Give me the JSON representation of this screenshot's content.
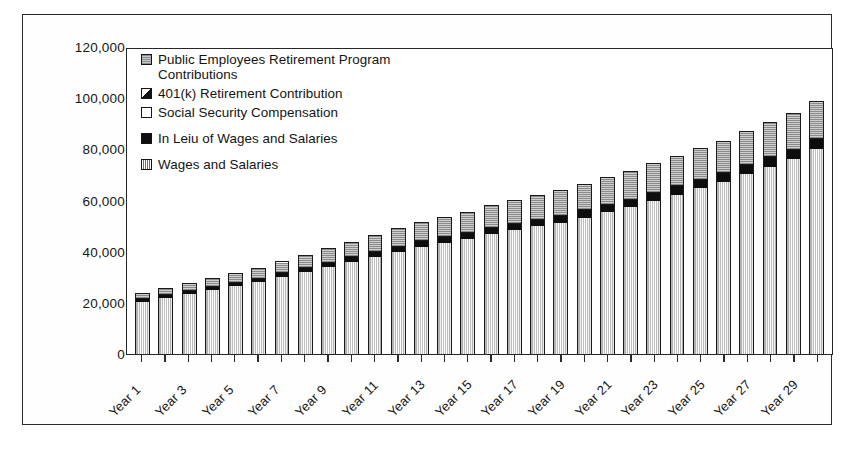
{
  "chart_data": {
    "type": "bar",
    "stacked": true,
    "title": "",
    "subtitle": "",
    "xlabel": "",
    "ylabel": "",
    "ylim": [
      0,
      120000
    ],
    "ytick_labels": [
      "120,000",
      "100,000",
      "80,000",
      "60,000",
      "40,000",
      "20,000",
      "0"
    ],
    "ytick_values": [
      120000,
      100000,
      80000,
      60000,
      40000,
      20000,
      0
    ],
    "grid": false,
    "legend_position": "top-left-inside",
    "categories": [
      "Year 1",
      "Year 2",
      "Year 3",
      "Year 4",
      "Year 5",
      "Year 6",
      "Year 7",
      "Year 8",
      "Year 9",
      "Year 10",
      "Year 11",
      "Year 12",
      "Year 13",
      "Year 14",
      "Year 15",
      "Year 16",
      "Year 17",
      "Year 18",
      "Year 19",
      "Year 20",
      "Year 21",
      "Year 22",
      "Year 23",
      "Year 24",
      "Year 25",
      "Year 26",
      "Year 27",
      "Year 28",
      "Year 29",
      "Year 30"
    ],
    "visible_tick_labels": [
      "Year 1",
      "Year 3",
      "Year 5",
      "Year 7",
      "Year 9",
      "Year 11",
      "Year 13",
      "Year 15",
      "Year 17",
      "Year 19",
      "Year 21",
      "Year 23",
      "Year 25",
      "Year 27",
      "Year 29"
    ],
    "series": [
      {
        "name": "Wages and Salaries",
        "swatch": "wages-hatch-swatch",
        "values": [
          21000,
          22500,
          24000,
          25500,
          27000,
          28500,
          30500,
          32500,
          34500,
          36500,
          38500,
          40500,
          42500,
          44000,
          45500,
          47500,
          49000,
          50500,
          52000,
          54000,
          56000,
          58000,
          60500,
          63000,
          65500,
          68000,
          71000,
          74000,
          77000,
          81000
        ]
      },
      {
        "name": "In Leiu of Wages and Salaries",
        "swatch": "lieu-solid-swatch",
        "values": [
          1100,
          1200,
          1250,
          1350,
          1450,
          1500,
          1600,
          1700,
          1800,
          1900,
          2000,
          2100,
          2200,
          2300,
          2400,
          2500,
          2600,
          2700,
          2800,
          2900,
          3000,
          3100,
          3200,
          3300,
          3400,
          3500,
          3600,
          3700,
          3800,
          3900
        ]
      },
      {
        "name": "Social Security Compensation",
        "swatch": "ssc-open-swatch",
        "values": [
          0,
          0,
          0,
          0,
          0,
          0,
          0,
          0,
          0,
          0,
          0,
          0,
          0,
          0,
          0,
          0,
          0,
          0,
          0,
          0,
          0,
          0,
          0,
          0,
          0,
          0,
          0,
          0,
          0,
          0
        ]
      },
      {
        "name": "401(k) Retirement Contribution",
        "swatch": "k401-diagonal-swatch",
        "values": [
          0,
          0,
          0,
          0,
          0,
          0,
          0,
          0,
          0,
          0,
          0,
          0,
          0,
          0,
          0,
          0,
          0,
          0,
          0,
          0,
          0,
          0,
          0,
          0,
          0,
          0,
          0,
          0,
          0,
          0
        ]
      },
      {
        "name": "Public Employees Retirement Program Contributions",
        "swatch": "pers-gray-swatch",
        "values": [
          2000,
          2300,
          2600,
          3000,
          3400,
          3800,
          4300,
          4800,
          5300,
          5800,
          6300,
          6800,
          7300,
          7700,
          8100,
          8500,
          8900,
          9300,
          9700,
          10100,
          10500,
          10900,
          11300,
          11700,
          12100,
          12500,
          13000,
          13500,
          14000,
          14600
        ]
      }
    ],
    "totals": [
      24100,
      26000,
      27850,
      29850,
      31850,
      33800,
      36400,
      39000,
      41600,
      44200,
      46800,
      49400,
      52000,
      54000,
      56000,
      58500,
      60500,
      62500,
      64500,
      67000,
      69500,
      72000,
      75000,
      78000,
      81000,
      84000,
      87600,
      91200,
      94800,
      99500
    ]
  },
  "legend": {
    "items": [
      {
        "label": "Public Employees Retirement Program Contributions",
        "swatch": "pers-gray-swatch"
      },
      {
        "label": "401(k) Retirement Contribution",
        "swatch": "k401-diagonal-swatch"
      },
      {
        "label": "Social Security Compensation",
        "swatch": "ssc-open-swatch"
      },
      {
        "label": "In Leiu of Wages and Salaries",
        "swatch": "lieu-solid-swatch"
      },
      {
        "label": "Wages and Salaries",
        "swatch": "wages-hatch-swatch"
      }
    ]
  },
  "colors": {
    "axis": "#262626",
    "frame": "#2b2b2b",
    "text": "#141414",
    "pers_fill": "#b0b0b0",
    "lieu_fill": "#0d0d0d",
    "wages_fill": "#ffffff",
    "background": "#ffffff"
  }
}
